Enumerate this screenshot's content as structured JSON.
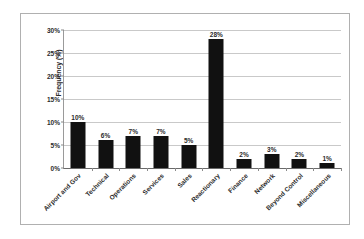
{
  "chart_data": {
    "type": "bar",
    "title": "",
    "xlabel": "",
    "ylabel": "Frequency (%)",
    "ylim": [
      0,
      30
    ],
    "ytick_labels": [
      "0%",
      "5%",
      "10%",
      "15%",
      "20%",
      "25%",
      "30%"
    ],
    "ytick_values": [
      0,
      5,
      10,
      15,
      20,
      25,
      30
    ],
    "grid": true,
    "legend": "none",
    "bar_color": "#111111",
    "gridline_color": "#c9c9c9",
    "categories": [
      "Airport and Gov",
      "Technical",
      "Operations",
      "Services",
      "Sales",
      "Reactionary",
      "Finance",
      "Network",
      "Beyond Control",
      "Miscellaneous"
    ],
    "values": [
      10,
      6,
      7,
      7,
      5,
      28,
      2,
      3,
      2,
      1
    ],
    "data_labels": [
      "10%",
      "6%",
      "7%",
      "7%",
      "5%",
      "28%",
      "2%",
      "3%",
      "2%",
      "1%"
    ]
  }
}
